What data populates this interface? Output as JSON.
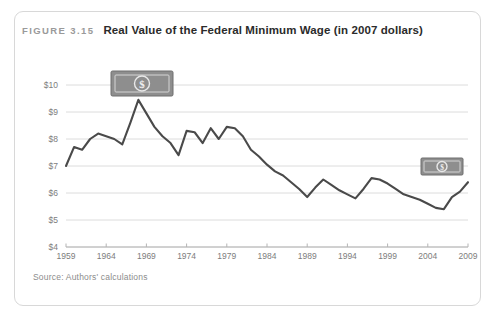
{
  "figure": {
    "label": "FIGURE 3.15",
    "title": "Real Value of the Federal Minimum Wage (in 2007 dollars)",
    "source": "Source: Authors' calculations"
  },
  "icons": {
    "large_bill": "dollar-bill-icon",
    "small_bill": "dollar-bill-icon",
    "currency_symbol": "$"
  },
  "colors": {
    "line": "#4a4a4a",
    "grid": "#dcdcdc",
    "axis": "#b4b4b4",
    "title": "#2b2b2b",
    "label": "#9a9a9a",
    "bill": "#8e8e8e",
    "card_border": "#d8d8d8",
    "background": "#ffffff"
  },
  "chart_data": {
    "type": "line",
    "title": "Real Value of the Federal Minimum Wage (in 2007 dollars)",
    "xlabel": "",
    "ylabel": "",
    "xlim": [
      1959,
      2009
    ],
    "ylim": [
      4,
      10
    ],
    "grid": true,
    "legend": "none",
    "ytick_labels": [
      "$10",
      "$9",
      "$8",
      "$7",
      "$6",
      "$5",
      "$4"
    ],
    "ytick_values": [
      10,
      9,
      8,
      7,
      6,
      5,
      4
    ],
    "xtick_labels": [
      "1959",
      "1964",
      "1969",
      "1974",
      "1979",
      "1984",
      "1989",
      "1994",
      "1999",
      "2004",
      "2009"
    ],
    "xtick_values": [
      1959,
      1964,
      1969,
      1974,
      1979,
      1984,
      1989,
      1994,
      1999,
      2004,
      2009
    ],
    "series": [
      {
        "name": "Real federal minimum wage (2007 dollars)",
        "x": [
          1959,
          1960,
          1961,
          1962,
          1963,
          1964,
          1965,
          1966,
          1967,
          1968,
          1969,
          1970,
          1971,
          1972,
          1973,
          1974,
          1975,
          1976,
          1977,
          1978,
          1979,
          1980,
          1981,
          1982,
          1983,
          1984,
          1985,
          1986,
          1987,
          1988,
          1989,
          1990,
          1991,
          1992,
          1993,
          1994,
          1995,
          1996,
          1997,
          1998,
          1999,
          2000,
          2001,
          2002,
          2003,
          2004,
          2005,
          2006,
          2007,
          2008,
          2009
        ],
        "y": [
          7.0,
          7.7,
          7.6,
          8.0,
          8.2,
          8.1,
          8.0,
          7.8,
          8.6,
          9.45,
          8.95,
          8.45,
          8.1,
          7.85,
          7.4,
          8.3,
          8.25,
          7.85,
          8.4,
          8.0,
          8.45,
          8.4,
          8.1,
          7.6,
          7.35,
          7.05,
          6.8,
          6.65,
          6.4,
          6.15,
          5.85,
          6.2,
          6.5,
          6.3,
          6.1,
          5.95,
          5.8,
          6.15,
          6.55,
          6.5,
          6.35,
          6.15,
          5.95,
          5.85,
          5.75,
          5.6,
          5.45,
          5.4,
          5.85,
          6.05,
          6.4
        ],
        "annotations": [
          {
            "label": "dollar-bill-icon-large",
            "at_x": 1967,
            "at_y": 10.0,
            "meaning": "high real value"
          },
          {
            "label": "dollar-bill-icon-small",
            "at_x": 2007,
            "at_y": 7.2,
            "meaning": "low real value"
          }
        ]
      }
    ]
  }
}
